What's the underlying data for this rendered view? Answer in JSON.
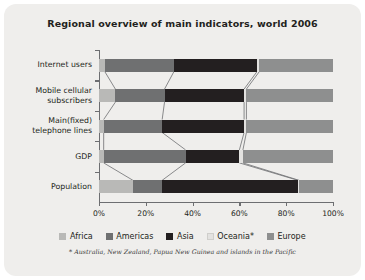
{
  "card": {
    "background": "#efeeec"
  },
  "chart_data": {
    "type": "bar",
    "orientation": "horizontal",
    "stacked": true,
    "normalized_percent": true,
    "title": "Regional overview of main indicators, world 2006",
    "xlabel": "",
    "ylabel": "",
    "xlim": [
      0,
      100
    ],
    "xticks": [
      0,
      20,
      40,
      60,
      80,
      100
    ],
    "xtick_labels": [
      "0%",
      "20%",
      "40%",
      "60%",
      "80%",
      "100%"
    ],
    "grid": false,
    "legend_position": "bottom",
    "categories": [
      "Internet users",
      "Mobile cellular subscribers",
      "Main(fixed) telephone lines",
      "GDP",
      "Population"
    ],
    "series": [
      {
        "name": "Africa",
        "color": "#b9b9b7",
        "values": [
          2.5,
          7.0,
          2.0,
          2.0,
          14.5
        ]
      },
      {
        "name": "Americas",
        "color": "#6f7071",
        "values": [
          29.5,
          21.0,
          25.0,
          35.0,
          12.5
        ]
      },
      {
        "name": "Asia",
        "color": "#231f20",
        "values": [
          35.5,
          34.0,
          35.0,
          23.0,
          58.0
        ]
      },
      {
        "name": "Oceania*",
        "color": "#e3e2e0",
        "values": [
          1.0,
          1.0,
          1.0,
          1.5,
          0.5
        ]
      },
      {
        "name": "Europe",
        "color": "#8e8f8f",
        "values": [
          31.5,
          37.0,
          37.0,
          38.5,
          14.5
        ]
      }
    ],
    "annotations": {
      "footnote": "* Australia, New Zealand, Papua New Guinea and islands in the Pacific"
    }
  },
  "legend": {
    "entries": [
      {
        "label": "Africa",
        "color": "#b9b9b7"
      },
      {
        "label": "Americas",
        "color": "#6f7071"
      },
      {
        "label": "Asia",
        "color": "#231f20"
      },
      {
        "label": "Oceania*",
        "color": "#e3e2e0"
      },
      {
        "label": "Europe",
        "color": "#8e8f8f"
      }
    ]
  }
}
